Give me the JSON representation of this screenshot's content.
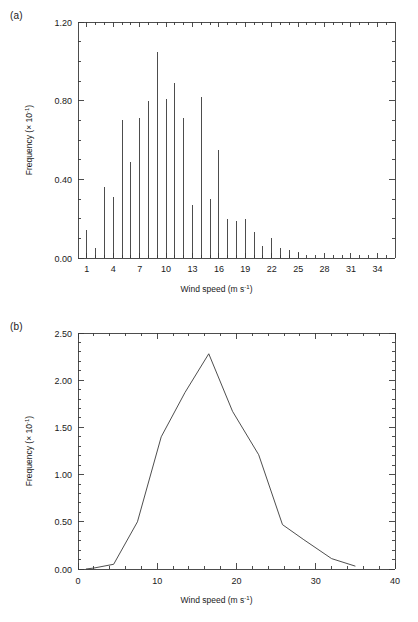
{
  "figure": {
    "panels": [
      {
        "id": "a",
        "label": "(a)"
      },
      {
        "id": "b",
        "label": "(b)"
      }
    ]
  },
  "chart_data": [
    {
      "type": "bar",
      "panel_label": "(a)",
      "title": "",
      "xlabel": "Wind speed (m s",
      "xlabel_sup": "-1",
      "xlabel_tail": ")",
      "ylabel": "Frequency (× 10",
      "ylabel_sup": "-1",
      "ylabel_tail": ")",
      "xlim": [
        0.0,
        36.0
      ],
      "ylim": [
        0.0,
        1.2
      ],
      "xticks": [
        1,
        4,
        7,
        10,
        13,
        16,
        19,
        22,
        25,
        28,
        31,
        34
      ],
      "xtick_labels": [
        "1",
        "4",
        "7",
        "10",
        "13",
        "16",
        "19",
        "22",
        "25",
        "28",
        "31",
        "34"
      ],
      "yticks": [
        0.0,
        0.4,
        0.8,
        1.2
      ],
      "ytick_labels": [
        "0.00",
        "0.40",
        "0.80",
        "1.20"
      ],
      "minor_x_step": 1,
      "minor_y_count": 4,
      "grid": false,
      "legend": "none",
      "categories": [
        1,
        2,
        3,
        4,
        5,
        6,
        7,
        8,
        9,
        10,
        11,
        12,
        13,
        14,
        15,
        16,
        17,
        18,
        19,
        20,
        21,
        22,
        23,
        24,
        25
      ],
      "values": [
        0.14,
        0.05,
        0.36,
        0.31,
        0.7,
        0.49,
        0.71,
        0.8,
        1.05,
        0.81,
        0.89,
        0.71,
        0.27,
        0.82,
        0.3,
        0.55,
        0.2,
        0.19,
        0.2,
        0.13,
        0.06,
        0.1,
        0.05,
        0.04,
        0.03
      ]
    },
    {
      "type": "line",
      "panel_label": "(b)",
      "title": "",
      "xlabel": "Wind speed (m s",
      "xlabel_sup": "-1",
      "xlabel_tail": ")",
      "ylabel": "Frequency (× 10",
      "ylabel_sup": "-1",
      "ylabel_tail": ")",
      "xlim": [
        0.0,
        40.0
      ],
      "ylim": [
        0.0,
        2.5
      ],
      "xticks": [
        0,
        10,
        20,
        30,
        40
      ],
      "xtick_labels": [
        "0",
        "10",
        "20",
        "30",
        "40"
      ],
      "yticks": [
        0.0,
        0.5,
        1.0,
        1.5,
        2.0,
        2.5
      ],
      "ytick_labels": [
        "0.00",
        "0.50",
        "1.00",
        "1.50",
        "2.00",
        "2.50"
      ],
      "minor_x_count": 5,
      "minor_y_count": 5,
      "grid": false,
      "legend": "none",
      "x": [
        1.0,
        2.0,
        4.5,
        7.5,
        10.5,
        13.5,
        16.5,
        19.5,
        22.8,
        25.8,
        28.5,
        32.0,
        35.0
      ],
      "values": [
        0.0,
        0.01,
        0.05,
        0.5,
        1.4,
        1.87,
        2.28,
        1.67,
        1.21,
        0.47,
        0.31,
        0.11,
        0.03
      ]
    }
  ]
}
